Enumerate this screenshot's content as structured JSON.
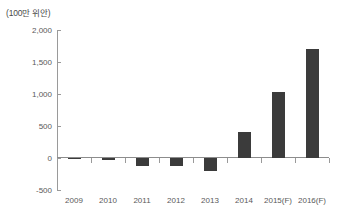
{
  "unit_label": "(100만 위안)",
  "colors": {
    "bar": "#3b3b3b",
    "axis": "#9a9a9a",
    "text": "#595959",
    "background": "#ffffff"
  },
  "chart_data": {
    "type": "bar",
    "title": "",
    "subtitle": "",
    "xlabel": "",
    "ylabel": "(100만 위안)",
    "categories": [
      "2009",
      "2010",
      "2011",
      "2012",
      "2013",
      "2014",
      "2015(F)",
      "2016(F)"
    ],
    "values": [
      -20,
      -30,
      -130,
      -130,
      -210,
      410,
      1030,
      1700
    ],
    "ylim": [
      -500,
      2000
    ],
    "yticks": [
      2000,
      1500,
      1000,
      500,
      0,
      -500
    ],
    "ytick_labels": [
      "2,000",
      "1,500",
      "1,000",
      "500",
      "0",
      "-500"
    ],
    "grid": false,
    "legend": null,
    "series": [
      {
        "name": "",
        "values": [
          -20,
          -30,
          -130,
          -130,
          -210,
          410,
          1030,
          1700
        ]
      }
    ]
  }
}
